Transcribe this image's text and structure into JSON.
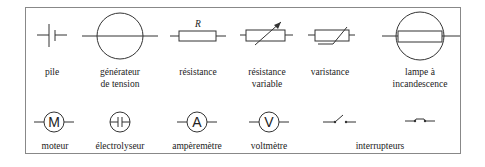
{
  "row1": [
    {
      "id": "pile",
      "label": "pile"
    },
    {
      "id": "generateur",
      "label": "générateur\nde tension"
    },
    {
      "id": "resistance",
      "label": "résistance",
      "symbol_text": "R"
    },
    {
      "id": "resistance-variable",
      "label": "résistance\nvariable"
    },
    {
      "id": "varistance",
      "label": "varistance"
    },
    {
      "id": "lampe",
      "label": "lampe à\nincandescence"
    }
  ],
  "row2": [
    {
      "id": "moteur",
      "label": "moteur",
      "symbol_text": "M"
    },
    {
      "id": "electrolyseur",
      "label": "électrolyseur"
    },
    {
      "id": "amperemetre",
      "label": "ampèremètre",
      "symbol_text": "A"
    },
    {
      "id": "voltmetre",
      "label": "voltmètre",
      "symbol_text": "V"
    },
    {
      "id": "interrupteurs",
      "label": "interrupteurs"
    }
  ],
  "colors": {
    "stroke": "#333333",
    "frame": "#888888"
  }
}
